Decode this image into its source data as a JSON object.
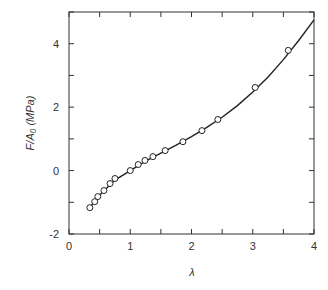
{
  "chart_data": {
    "type": "scatter",
    "title": "",
    "xlabel": "λ",
    "ylabel": "F/A₀ (MPa)",
    "xlim": [
      0,
      4
    ],
    "ylim": [
      -2,
      5
    ],
    "xticks": [
      0,
      1,
      2,
      3,
      4
    ],
    "yticks": [
      -2,
      0,
      2,
      4
    ],
    "grid": false,
    "legend": null,
    "series": [
      {
        "name": "data",
        "marker": "open-circle",
        "x": [
          0.34,
          0.42,
          0.47,
          0.57,
          0.67,
          0.75,
          1.0,
          1.13,
          1.24,
          1.37,
          1.57,
          1.86,
          2.17,
          2.43,
          3.04,
          3.58
        ],
        "y": [
          -1.17,
          -0.98,
          -0.82,
          -0.63,
          -0.41,
          -0.25,
          0.0,
          0.19,
          0.32,
          0.44,
          0.63,
          0.91,
          1.26,
          1.61,
          2.62,
          3.79
        ]
      },
      {
        "name": "fit",
        "style": "line",
        "x": [
          0.34,
          0.5,
          0.75,
          1.0,
          1.25,
          1.5,
          1.75,
          2.0,
          2.25,
          2.5,
          2.75,
          3.0,
          3.25,
          3.5,
          3.75,
          4.0
        ],
        "y": [
          -1.17,
          -0.78,
          -0.3,
          0.0,
          0.3,
          0.55,
          0.8,
          1.07,
          1.36,
          1.68,
          2.05,
          2.48,
          2.95,
          3.5,
          4.1,
          4.75
        ]
      }
    ]
  },
  "labels": {
    "xlabel": "λ",
    "ylabel": "F/A₀ (MPa)",
    "xticks": [
      "0",
      "1",
      "2",
      "3",
      "4"
    ],
    "yticks": [
      "-2",
      "0",
      "2",
      "4"
    ]
  }
}
